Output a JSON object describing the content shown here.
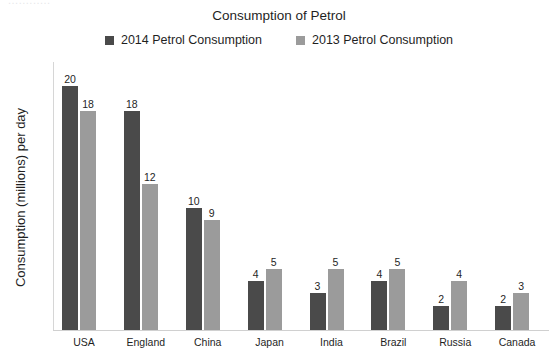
{
  "artifact_text": "............",
  "chart_data": {
    "type": "bar",
    "title": "Consumption of Petrol",
    "xlabel": "",
    "ylabel": "Consumption (millions) per day",
    "ylim": [
      0,
      22
    ],
    "grid": false,
    "legend_position": "top-center",
    "categories": [
      "USA",
      "England",
      "China",
      "Japan",
      "India",
      "Brazil",
      "Russia",
      "Canada"
    ],
    "series": [
      {
        "name": "2014 Petrol Consumption",
        "color": "#4a4a4a",
        "values": [
          20,
          18,
          10,
          4,
          3,
          4,
          2,
          2
        ]
      },
      {
        "name": "2013 Petrol Consumption",
        "color": "#9b9b9b",
        "values": [
          18,
          12,
          9,
          5,
          5,
          5,
          4,
          3
        ]
      }
    ]
  }
}
